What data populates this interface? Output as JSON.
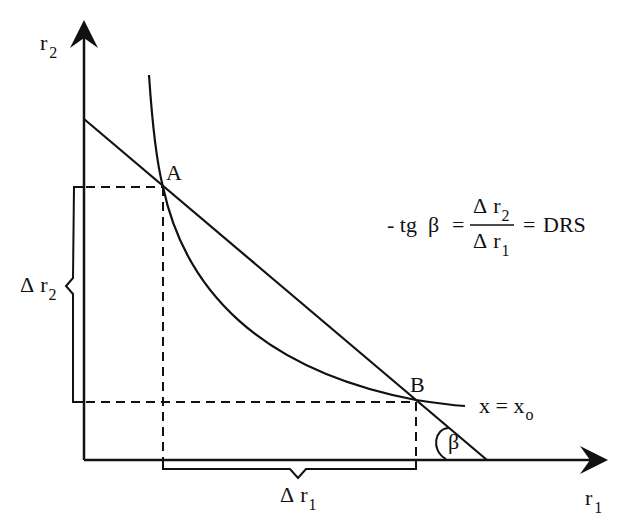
{
  "diagram": {
    "type": "isoquant",
    "axes": {
      "x_label": "r",
      "x_label_sub": "1",
      "y_label": "r",
      "y_label_sub": "2"
    },
    "points": {
      "A": {
        "label": "A"
      },
      "B": {
        "label": "B"
      }
    },
    "curve": {
      "label_lhs": "x = x",
      "label_sub": "o"
    },
    "angle": {
      "label": "β"
    },
    "delta_r2": {
      "delta": "Δ",
      "var": "r",
      "sub": "2"
    },
    "delta_r1": {
      "delta": "Δ",
      "var": "r",
      "sub": "1"
    },
    "formula": {
      "lhs": "- tg  β",
      "eq1": "=",
      "numerator_delta": "Δ",
      "numerator_var": "r",
      "numerator_sub": "2",
      "denominator_delta": "Δ",
      "denominator_var": "r",
      "denominator_sub": "1",
      "eq2": "=",
      "rhs": "DRS"
    },
    "colors": {
      "ink": "#111111",
      "background": "#ffffff"
    }
  }
}
